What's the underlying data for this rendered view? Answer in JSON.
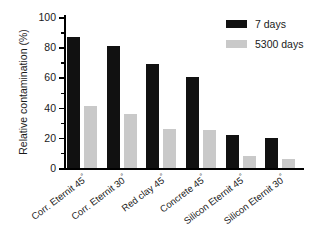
{
  "chart_data": {
    "type": "bar",
    "title": "",
    "xlabel": "",
    "ylabel": "Relative contamination (%)",
    "ylim": [
      0,
      100
    ],
    "yticks": [
      0,
      20,
      40,
      60,
      80,
      100
    ],
    "ytick_labels": [
      "0",
      "20",
      "40",
      "60",
      "80",
      "100"
    ],
    "grid": false,
    "legend_position": "top-right",
    "categories": [
      "Corr. Eternit 45°",
      "Corr. Eternit 30°",
      "Red clay 45°",
      "Concrete 45°",
      "Silicon Eternit 45°",
      "Silicon Eternit 30°"
    ],
    "series": [
      {
        "name": "7 days",
        "color": "#111111",
        "values": [
          87,
          81,
          69,
          60,
          22,
          20
        ]
      },
      {
        "name": "5300 days",
        "color": "#c9c9c9",
        "values": [
          41,
          36,
          26,
          25,
          8,
          6
        ]
      }
    ]
  },
  "axis": {
    "y_title": "Relative contamination (%)"
  },
  "legend": {
    "items": [
      {
        "label": "7 days",
        "color": "#111111"
      },
      {
        "label": "5300 days",
        "color": "#c9c9c9"
      }
    ]
  }
}
